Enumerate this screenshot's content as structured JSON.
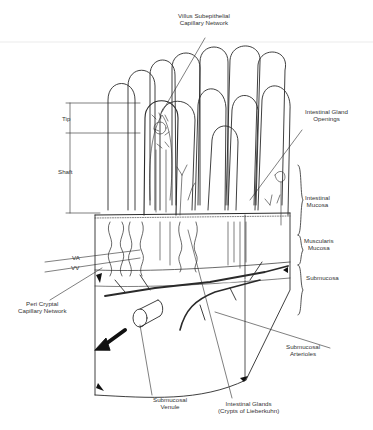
{
  "diagram": {
    "labels": {
      "villus_capillary": [
        "Villus Subepithelial",
        "Capillary Network"
      ],
      "gland_openings": [
        "Intestinal Gland",
        "Openings"
      ],
      "tip": "Tip",
      "shaft": "Shaft",
      "intestinal_mucosa": [
        "Intestinal",
        "Mucosa"
      ],
      "muscularis_mucosa": [
        "Muscularis",
        "Mucosa"
      ],
      "submucosa": "Submucosa",
      "va": "VA",
      "vv": "VV",
      "peri_cryptal": [
        "Peri Cryptal",
        "Capillary Network"
      ],
      "submucosal_arterioles": [
        "Submucosal",
        "Arterioles"
      ],
      "submucosal_venule": [
        "Submucosal",
        "Venule"
      ],
      "intestinal_glands": [
        "Intestinal Glands",
        "(Crypts of Lieberkuhn)"
      ]
    },
    "colors": {
      "line": "#2a2a2a",
      "background": "#ffffff",
      "shade": "#111111"
    }
  }
}
